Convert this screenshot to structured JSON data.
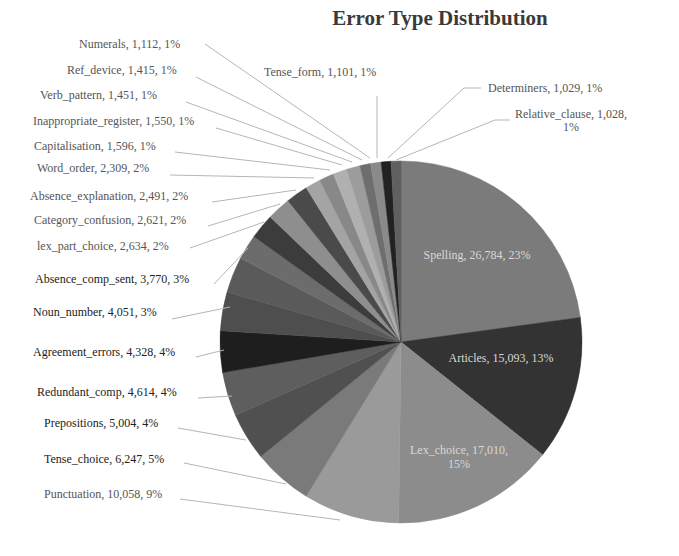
{
  "chart_data": {
    "type": "pie",
    "title": "Error Type Distribution",
    "start_angle_deg": 0,
    "direction": "clockwise",
    "label_format": "{name}, {value}, {pct}",
    "slices": [
      {
        "name": "Spelling",
        "value": 26784,
        "value_label": "26,784",
        "pct": "23%",
        "color": "#7b7b7b"
      },
      {
        "name": "Articles",
        "value": 15093,
        "value_label": "15,093",
        "pct": "13%",
        "color": "#333333"
      },
      {
        "name": "Lex_choice",
        "value": 17010,
        "value_label": "17,010",
        "pct": "15%",
        "color": "#8c8c8c"
      },
      {
        "name": "Punctuation",
        "value": 10058,
        "value_label": "10,058",
        "pct": "9%",
        "color": "#9a9a9a"
      },
      {
        "name": "Tense_choice",
        "value": 6247,
        "value_label": "6,247",
        "pct": "5%",
        "color": "#7a7a7a"
      },
      {
        "name": "Prepositions",
        "value": 5004,
        "value_label": "5,004",
        "pct": "4%",
        "color": "#505050"
      },
      {
        "name": "Redundant_comp",
        "value": 4614,
        "value_label": "4,614",
        "pct": "4%",
        "color": "#5e5e5e"
      },
      {
        "name": "Agreement_errors",
        "value": 4328,
        "value_label": "4,328",
        "pct": "4%",
        "color": "#1e1e1e"
      },
      {
        "name": "Noun_number",
        "value": 4051,
        "value_label": "4,051",
        "pct": "3%",
        "color": "#4e4e4e"
      },
      {
        "name": "Absence_comp_sent",
        "value": 3770,
        "value_label": "3,770",
        "pct": "3%",
        "color": "#5a5a5a"
      },
      {
        "name": "lex_part_choice",
        "value": 2634,
        "value_label": "2,634",
        "pct": "2%",
        "color": "#6c6c6c"
      },
      {
        "name": "Category_confusion",
        "value": 2621,
        "value_label": "2,621",
        "pct": "2%",
        "color": "#3c3c3c"
      },
      {
        "name": "Absence_explanation",
        "value": 2491,
        "value_label": "2,491",
        "pct": "2%",
        "color": "#8e8e8e"
      },
      {
        "name": "Word_order",
        "value": 2309,
        "value_label": "2,309",
        "pct": "2%",
        "color": "#4a4a4a"
      },
      {
        "name": "Capitalisation",
        "value": 1596,
        "value_label": "1,596",
        "pct": "1%",
        "color": "#a4a4a4"
      },
      {
        "name": "Inappropriate_register",
        "value": 1550,
        "value_label": "1,550",
        "pct": "1%",
        "color": "#888888"
      },
      {
        "name": "Verb_pattern",
        "value": 1451,
        "value_label": "1,451",
        "pct": "1%",
        "color": "#b0b0b0"
      },
      {
        "name": "Ref_device",
        "value": 1415,
        "value_label": "1,415",
        "pct": "1%",
        "color": "#9c9c9c"
      },
      {
        "name": "Numerals",
        "value": 1112,
        "value_label": "1,112",
        "pct": "1%",
        "color": "#6e6e6e"
      },
      {
        "name": "Tense_form",
        "value": 1101,
        "value_label": "1,101",
        "pct": "1%",
        "color": "#8a8a8a"
      },
      {
        "name": "Determiners",
        "value": 1029,
        "value_label": "1,029",
        "pct": "1%",
        "color": "#222222"
      },
      {
        "name": "Relative_clause",
        "value": 1028,
        "value_label": "1,028",
        "pct": "1%",
        "color": "#606060"
      }
    ]
  },
  "labels": {
    "numerals": "Numerals, 1,112, 1%",
    "ref_device": "Ref_device, 1,415, 1%",
    "verb_pattern": "Verb_pattern, 1,451, 1%",
    "inappropriate_register": "Inappropriate_register, 1,550, 1%",
    "capitalisation": "Capitalisation, 1,596, 1%",
    "word_order": "Word_order, 2,309, 2%",
    "absence_explanation": "Absence_explanation, 2,491, 2%",
    "category_confusion": "Category_confusion, 2,621, 2%",
    "lex_part_choice": "lex_part_choice, 2,634, 2%",
    "absence_comp_sent": "Absence_comp_sent, 3,770, 3%",
    "noun_number": "Noun_number, 4,051, 3%",
    "agreement_errors": "Agreement_errors, 4,328, 4%",
    "redundant_comp": "Redundant_comp, 4,614, 4%",
    "prepositions": "Prepositions, 5,004, 4%",
    "tense_choice": "Tense_choice, 6,247, 5%",
    "punctuation": "Punctuation, 10,058, 9%",
    "tense_form": "Tense_form, 1,101, 1%",
    "determiners": "Determiners, 1,029, 1%",
    "relative_clause_1": "Relative_clause, 1,028,",
    "relative_clause_2": "1%",
    "spelling": "Spelling, 26,784, 23%",
    "articles": "Articles, 15,093, 13%",
    "lex_choice_1": "Lex_choice, 17,010,",
    "lex_choice_2": "15%"
  }
}
